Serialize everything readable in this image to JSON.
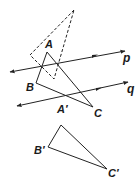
{
  "figure": {
    "colors": {
      "stroke": "#222222",
      "background": "#ffffff"
    },
    "labels": {
      "A": "A",
      "B": "B",
      "C": "C",
      "A_prime": "A′",
      "B_prime": "B′",
      "C_prime": "C′",
      "p": "p",
      "q": "q"
    },
    "dashed_triangle": {
      "points": "74,10 30,55 54,79",
      "style": "dashed"
    },
    "triangle_ABC": {
      "points": "47,52 36,83 93,107",
      "A": [
        47,
        52
      ],
      "B": [
        36,
        83
      ],
      "C": [
        93,
        107
      ]
    },
    "triangle_A_prime_B_prime_C_prime": {
      "points": "61,125 48,147 107,169",
      "A_prime": [
        61,
        125
      ],
      "B_prime": [
        48,
        147
      ],
      "C_prime": [
        107,
        169
      ]
    },
    "line_p": {
      "from": [
        10,
        72
      ],
      "to": [
        125,
        51
      ]
    },
    "line_q": {
      "from": [
        17,
        106
      ],
      "to": [
        128,
        82
      ]
    }
  }
}
